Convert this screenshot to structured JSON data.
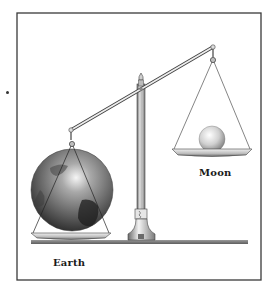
{
  "figure": {
    "type": "illustration",
    "labels": {
      "earth": "Earth",
      "moon": "Moon"
    },
    "colors": {
      "frame": "#3a3a3a",
      "ink": "#2a2a2a",
      "base_bar": "#7a7a7a",
      "earth_dark": "#2e2e2e",
      "earth_light": "#d9d9d9",
      "moon_light": "#f2f2f2",
      "moon_dark": "#8a8a8a",
      "pan": "#bdbdbd"
    },
    "elements": [
      "frame",
      "balance-beam",
      "pillar",
      "finial",
      "base-platform",
      "left-pan-with-earth",
      "right-pan-with-moon"
    ],
    "beam_state": "tilted — Earth side down, Moon side up"
  }
}
